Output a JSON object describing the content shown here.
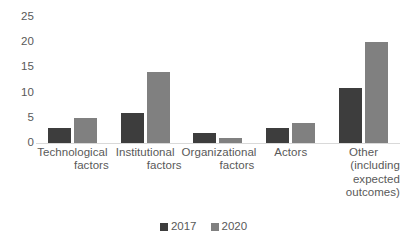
{
  "chart_data": {
    "type": "bar",
    "title": "",
    "subtitle": "",
    "xlabel": "",
    "ylabel": "",
    "ylim": [
      0,
      25
    ],
    "yticks": [
      0,
      5,
      10,
      15,
      20,
      25
    ],
    "grid": false,
    "legend_position": "bottom-center",
    "categories": [
      "Technological factors",
      "Institutional factors",
      "Organizational factors",
      "Actors",
      "Other (including expected outcomes)"
    ],
    "category_lines": [
      [
        "Technological",
        "factors"
      ],
      [
        "Institutional",
        "factors"
      ],
      [
        "Organizational",
        "factors"
      ],
      [
        "Actors"
      ],
      [
        "Other",
        "(including",
        "expected",
        "outcomes)"
      ]
    ],
    "series": [
      {
        "name": "2017",
        "color": "#3d3d3d",
        "values": [
          3,
          6,
          2,
          3,
          11
        ]
      },
      {
        "name": "2020",
        "color": "#808080",
        "values": [
          5,
          14,
          1,
          4,
          20
        ]
      }
    ]
  },
  "axis": {
    "tick_labels": [
      "25",
      "20",
      "15",
      "10",
      "5",
      "0"
    ]
  },
  "legend": {
    "items": [
      {
        "label": "2017",
        "color": "#3d3d3d"
      },
      {
        "label": "2020",
        "color": "#808080"
      }
    ]
  },
  "colors": {
    "series_2017": "#3d3d3d",
    "series_2020": "#808080",
    "axis_line": "#d9d9d9",
    "text": "#595959",
    "background": "#ffffff"
  }
}
